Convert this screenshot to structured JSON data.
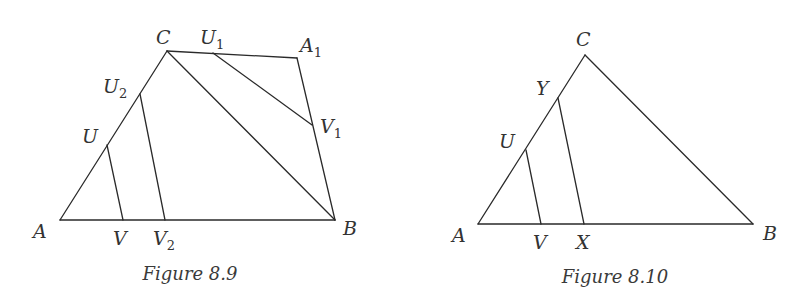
{
  "figures": [
    {
      "id": "fig-8-9",
      "caption": "Figure 8.9",
      "caption_pos": [
        190,
        280
      ],
      "points": {
        "A": {
          "label": "A",
          "sub": "",
          "xy": [
            60,
            220
          ],
          "label_xy": [
            33,
            238
          ]
        },
        "B": {
          "label": "B",
          "sub": "",
          "xy": [
            335,
            220
          ],
          "label_xy": [
            343,
            235
          ]
        },
        "C": {
          "label": "C",
          "sub": "",
          "xy": [
            167,
            51
          ],
          "label_xy": [
            156,
            44
          ]
        },
        "A1": {
          "label": "A",
          "sub": "1",
          "xy": [
            297,
            58
          ],
          "label_xy": [
            300,
            52
          ]
        },
        "U1": {
          "label": "U",
          "sub": "1",
          "xy": [
            213,
            53
          ],
          "label_xy": [
            200,
            44
          ]
        },
        "V1": {
          "label": "V",
          "sub": "1",
          "xy": [
            312,
            125
          ],
          "label_xy": [
            320,
            133
          ]
        },
        "U2": {
          "label": "U",
          "sub": "2",
          "xy": [
            140,
            94
          ],
          "label_xy": [
            103,
            93
          ]
        },
        "V2": {
          "label": "V",
          "sub": "2",
          "xy": [
            165,
            220
          ],
          "label_xy": [
            153,
            245
          ]
        },
        "U": {
          "label": "U",
          "sub": "",
          "xy": [
            107,
            145
          ],
          "label_xy": [
            82,
            143
          ]
        },
        "V": {
          "label": "V",
          "sub": "",
          "xy": [
            123,
            220
          ],
          "label_xy": [
            113,
            245
          ]
        }
      },
      "segments": [
        [
          "A",
          "B"
        ],
        [
          "A",
          "C"
        ],
        [
          "C",
          "B"
        ],
        [
          "C",
          "A1"
        ],
        [
          "A1",
          "B"
        ],
        [
          "U1",
          "V1"
        ],
        [
          "U2",
          "V2"
        ],
        [
          "U",
          "V"
        ]
      ]
    },
    {
      "id": "fig-8-10",
      "caption": "Figure 8.10",
      "caption_pos": [
        615,
        283
      ],
      "points": {
        "A": {
          "label": "A",
          "sub": "",
          "xy": [
            478,
            224
          ],
          "label_xy": [
            452,
            242
          ]
        },
        "B": {
          "label": "B",
          "sub": "",
          "xy": [
            753,
            224
          ],
          "label_xy": [
            763,
            240
          ]
        },
        "C": {
          "label": "C",
          "sub": "",
          "xy": [
            585,
            55
          ],
          "label_xy": [
            576,
            46
          ]
        },
        "Y": {
          "label": "Y",
          "sub": "",
          "xy": [
            558,
            98
          ],
          "label_xy": [
            536,
            95
          ]
        },
        "U": {
          "label": "U",
          "sub": "",
          "xy": [
            526,
            150
          ],
          "label_xy": [
            499,
            148
          ]
        },
        "V": {
          "label": "V",
          "sub": "",
          "xy": [
            541,
            224
          ],
          "label_xy": [
            533,
            249
          ]
        },
        "X": {
          "label": "X",
          "sub": "",
          "xy": [
            584,
            224
          ],
          "label_xy": [
            576,
            249
          ]
        }
      },
      "segments": [
        [
          "A",
          "B"
        ],
        [
          "A",
          "C"
        ],
        [
          "C",
          "B"
        ],
        [
          "Y",
          "X"
        ],
        [
          "U",
          "V"
        ]
      ]
    }
  ],
  "colors": {
    "line": "#2a2a2a",
    "label": "#333333",
    "background": "#ffffff"
  }
}
